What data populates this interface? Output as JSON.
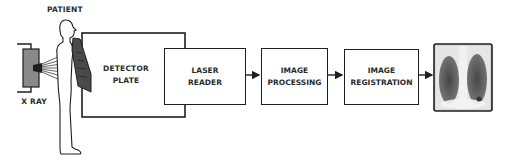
{
  "diagram": {
    "type": "flow",
    "title": "",
    "labels": {
      "patient": "PATIENT",
      "xray": "X RAY"
    },
    "nodes": [
      {
        "id": "detector",
        "label": "DETECTOR\nPLATE"
      },
      {
        "id": "laser",
        "label": "LASER\nREADER"
      },
      {
        "id": "processing",
        "label": "IMAGE\nPROCESSING"
      },
      {
        "id": "registration",
        "label": "IMAGE\nREGISTRATION"
      },
      {
        "id": "output",
        "label": "chest x-ray image"
      }
    ],
    "edges": [
      {
        "from": "xray",
        "to": "patient"
      },
      {
        "from": "patient",
        "to": "detector"
      },
      {
        "from": "detector",
        "to": "laser"
      },
      {
        "from": "laser",
        "to": "processing"
      },
      {
        "from": "processing",
        "to": "registration"
      },
      {
        "from": "registration",
        "to": "output"
      }
    ],
    "colors": {
      "stroke": "#1f1f1f",
      "plate": "#4a4a4a",
      "xray_source": "#8a8a8a"
    }
  }
}
